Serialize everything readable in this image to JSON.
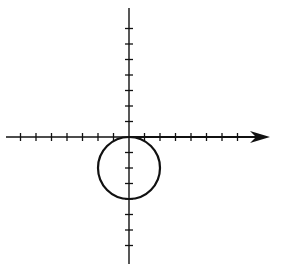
{
  "diagram": {
    "title": "",
    "colors": {
      "background": "#ffffff",
      "stroke": "#111111"
    },
    "origin": {
      "x": 129,
      "y": 137
    },
    "tick_spacing_px": 15.5,
    "tick_half_length_px": 4,
    "x_axis": {
      "start_x": 6,
      "end_x": 270,
      "arrow": "right",
      "ticks_negative": 7,
      "ticks_positive": 7
    },
    "y_axis": {
      "start_y": 8,
      "end_y": 264,
      "arrow": "none",
      "ticks_positive": 7,
      "ticks_negative": 7
    },
    "circle": {
      "center_units": {
        "x": 0,
        "y": -2
      },
      "radius_units": 2,
      "description": "circle tangent to x-axis at origin, centered on negative y-axis"
    }
  }
}
